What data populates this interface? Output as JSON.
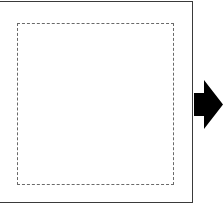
{
  "diagram": {
    "outer_box": {
      "border_color": "#3a3a3a",
      "border_style": "solid"
    },
    "inner_box": {
      "border_color": "#6a6a6a",
      "border_style": "dashed"
    },
    "arrow": {
      "direction": "right",
      "color": "#000000",
      "icon": "arrow-right-icon"
    }
  }
}
